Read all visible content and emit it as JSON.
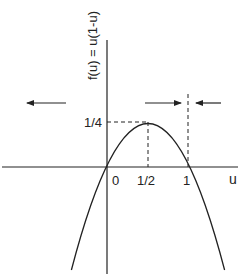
{
  "diagram": {
    "y_axis_label": "f(u) = u(1-u)",
    "x_axis_label": "u",
    "tick_labels": {
      "y_quarter": "1/4",
      "x_zero": "0",
      "x_half": "1/2",
      "x_one": "1"
    },
    "curve": {
      "function": "u(1-u)",
      "type": "parabola",
      "vertex": {
        "u": 0.5,
        "f": 0.25
      },
      "roots": [
        0,
        1
      ],
      "u_range": [
        -0.44,
        1.44
      ]
    },
    "arrows": [
      {
        "id": "left-region",
        "direction": "left"
      },
      {
        "id": "middle-region",
        "direction": "right"
      },
      {
        "id": "right-region",
        "direction": "left"
      }
    ],
    "colors": {
      "stroke": "#222222",
      "background": "#ffffff"
    }
  }
}
